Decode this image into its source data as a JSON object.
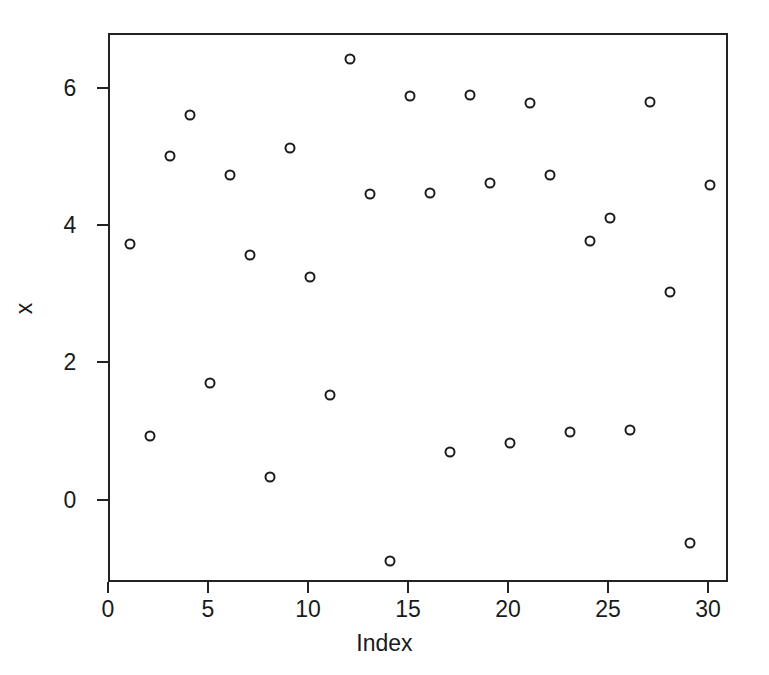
{
  "chart_data": {
    "type": "scatter",
    "title": "",
    "xlabel": "Index",
    "ylabel": "x",
    "xlim": [
      0.0,
      31.0
    ],
    "ylim": [
      -1.2,
      6.8
    ],
    "xticks": [
      0,
      5,
      10,
      15,
      20,
      25,
      30
    ],
    "xtick_labels": [
      "0",
      "5",
      "10",
      "15",
      "20",
      "25",
      "30"
    ],
    "yticks": [
      0,
      2,
      4,
      6
    ],
    "ytick_labels": [
      "0",
      "2",
      "4",
      "6"
    ],
    "grid": false,
    "legend": false,
    "marker": "open-circle",
    "marker_color": "#1c1c1c",
    "background_color": "#ffffff",
    "axis_color": "#222222",
    "n_points": 30,
    "x": [
      1,
      2,
      3,
      4,
      5,
      6,
      7,
      8,
      9,
      10,
      11,
      12,
      13,
      14,
      15,
      16,
      17,
      18,
      19,
      20,
      21,
      22,
      23,
      24,
      25,
      26,
      27,
      28,
      29,
      30
    ],
    "y": [
      3.76,
      0.96,
      5.03,
      5.64,
      1.73,
      4.76,
      3.59,
      0.36,
      5.15,
      3.27,
      1.55,
      6.45,
      4.48,
      -0.87,
      5.91,
      4.5,
      0.73,
      5.93,
      4.64,
      0.86,
      5.81,
      4.76,
      1.02,
      3.8,
      4.13,
      1.05,
      5.83,
      3.06,
      -0.6,
      4.61
    ],
    "points": [
      {
        "index": 1,
        "value": 3.76
      },
      {
        "index": 2,
        "value": 0.96
      },
      {
        "index": 3,
        "value": 5.03
      },
      {
        "index": 4,
        "value": 5.64
      },
      {
        "index": 5,
        "value": 1.73
      },
      {
        "index": 6,
        "value": 4.76
      },
      {
        "index": 7,
        "value": 3.59
      },
      {
        "index": 8,
        "value": 0.36
      },
      {
        "index": 9,
        "value": 5.15
      },
      {
        "index": 10,
        "value": 3.27
      },
      {
        "index": 11,
        "value": 1.55
      },
      {
        "index": 12,
        "value": 6.45
      },
      {
        "index": 13,
        "value": 4.48
      },
      {
        "index": 14,
        "value": -0.87
      },
      {
        "index": 15,
        "value": 5.91
      },
      {
        "index": 16,
        "value": 4.5
      },
      {
        "index": 17,
        "value": 0.73
      },
      {
        "index": 18,
        "value": 5.93
      },
      {
        "index": 19,
        "value": 4.64
      },
      {
        "index": 20,
        "value": 0.86
      },
      {
        "index": 21,
        "value": 5.81
      },
      {
        "index": 22,
        "value": 4.76
      },
      {
        "index": 23,
        "value": 1.02
      },
      {
        "index": 24,
        "value": 3.8
      },
      {
        "index": 25,
        "value": 4.13
      },
      {
        "index": 26,
        "value": 1.05
      },
      {
        "index": 27,
        "value": 5.83
      },
      {
        "index": 28,
        "value": 3.06
      },
      {
        "index": 29,
        "value": -0.6
      },
      {
        "index": 30,
        "value": 4.61
      }
    ]
  }
}
